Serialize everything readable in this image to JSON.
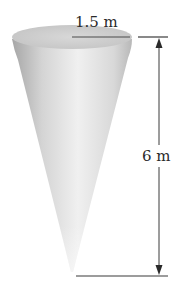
{
  "figure": {
    "type": "cone-diagram",
    "labels": {
      "radius": "1.5 m",
      "height": "6 m"
    },
    "colors": {
      "cone_light": "#ececec",
      "cone_dark": "#9a9a9a",
      "top_face": "#cfcfcf",
      "lines": "#3a3a3a"
    }
  }
}
